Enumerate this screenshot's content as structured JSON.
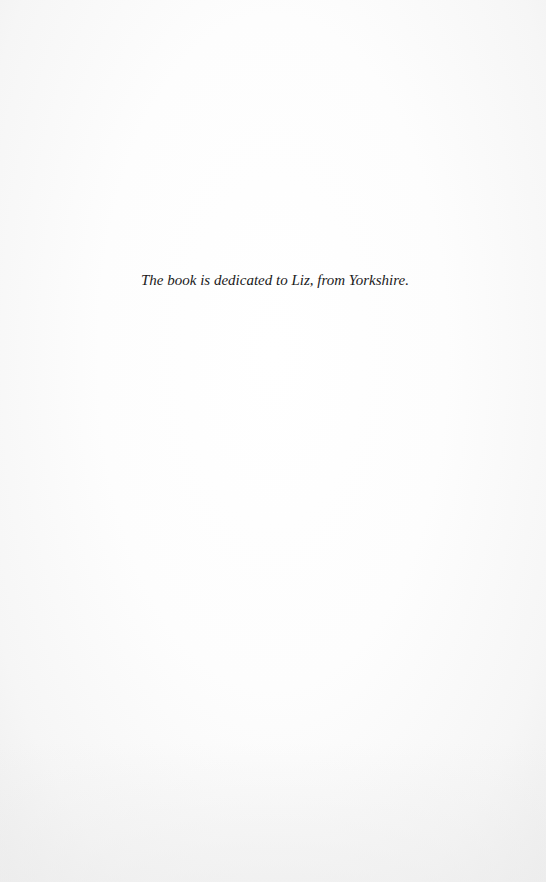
{
  "page": {
    "dedication": "The book is dedicated to Liz, from Yorkshire."
  }
}
